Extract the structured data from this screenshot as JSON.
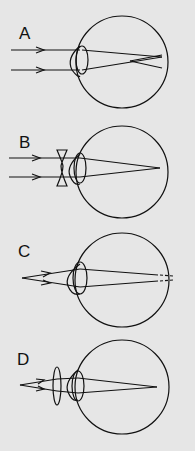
{
  "figure": {
    "background": "#e6e6e6",
    "stroke": "#111111",
    "panels": [
      {
        "label": "A",
        "description": "Parallel rays focus in front of the retina (myopia)"
      },
      {
        "label": "B",
        "description": "Concave (diverging) lens corrects focus onto the retina"
      },
      {
        "label": "C",
        "description": "Near object rays focus behind the retina (hyperopia)"
      },
      {
        "label": "D",
        "description": "Convex (converging) lens corrects focus onto the retina"
      }
    ]
  }
}
